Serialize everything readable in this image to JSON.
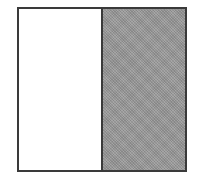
{
  "diagram": {
    "left_half": {
      "fill": "#ffffff",
      "label": ""
    },
    "right_half": {
      "fill": "#9a9a9a",
      "pattern": "stippled",
      "label": ""
    },
    "border_color": "#3a3a3a"
  }
}
